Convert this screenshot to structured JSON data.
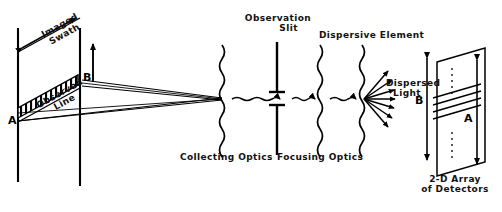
{
  "diagram": {
    "title_hidden": "Imaging spectrometer optical path",
    "labels": {
      "imaged_swath": "Imaged\nSwath",
      "observed_line": "Observed\nLine",
      "point_a_scene": "A",
      "point_b_scene": "B",
      "observation_slit": "Observation\n      Slit",
      "dispersive_element": "Dispersive Element",
      "dispersed_light": "Dispersed\n  Light",
      "collecting_optics": "Collecting Optics",
      "focusing_optics": "Focusing Optics",
      "detector_array": "2-D Array\nof Detectors",
      "point_b_detector": "B",
      "point_a_detector": "A"
    },
    "icons": {
      "swath_arrow": "double-arrow-icon",
      "scan_arrow": "up-arrow-icon",
      "beam_arrow": "wavy-ray-arrow-icon",
      "fan_arrows": "dispersed-fan-icon",
      "optic_surface": "wavy-lens-icon",
      "slit_jaw": "slit-jaw-icon",
      "detector_extent_arrow": "double-arrow-icon"
    },
    "counts": {
      "observed_line_hatches": 12,
      "dispersed_fan_rays": 7,
      "spectral_band_lines": 4,
      "detector_dotted_columns": 2
    },
    "colors": {
      "ink": "#000000",
      "background": "#ffffff"
    }
  }
}
